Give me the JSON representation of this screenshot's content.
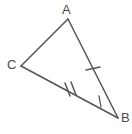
{
  "figure": {
    "kind": "geometry-diagram",
    "background_color": "#ffffff",
    "stroke_color": "#555555",
    "label_color": "#4a4a4a",
    "canvas": {
      "width": 132,
      "height": 134
    }
  },
  "labels": {
    "a": "A",
    "b": "B",
    "c": "C"
  },
  "chart_data": {
    "type": "diagram",
    "vertices": [
      {
        "name": "A",
        "label": "A",
        "x": 68,
        "y": 19
      },
      {
        "name": "C",
        "label": "C",
        "x": 21,
        "y": 66
      },
      {
        "name": "B",
        "label": "B",
        "x": 118,
        "y": 118
      }
    ],
    "sides": [
      {
        "name": "AC",
        "from": "A",
        "to": "C",
        "tick_count": 0
      },
      {
        "name": "AB",
        "from": "A",
        "to": "B",
        "tick_count": 1
      },
      {
        "name": "CB",
        "from": "C",
        "to": "B",
        "tick_count": 2
      }
    ],
    "tick_marks": [
      {
        "side": "AB",
        "count": 1,
        "x": 93,
        "y": 69
      },
      {
        "side": "CB",
        "count": 2,
        "x": 69,
        "y": 89
      }
    ],
    "angle_marks": [
      {
        "vertex": "B",
        "style": "single-arc"
      }
    ]
  },
  "geometry": {
    "side_AC_path": "M 68 19 L 21 66",
    "side_AB_path": "M 68 19 L 118 118",
    "side_CB_path": "M 21 66 L 118 118",
    "tick_AB_path": "M 86 70 L 100 67",
    "tick_CB_path_1": "M 65 83 L 70 96",
    "tick_CB_path_2": "M 71 82 L 76 95",
    "angle_arc_B_path": "M 99 96 L 101 107"
  }
}
